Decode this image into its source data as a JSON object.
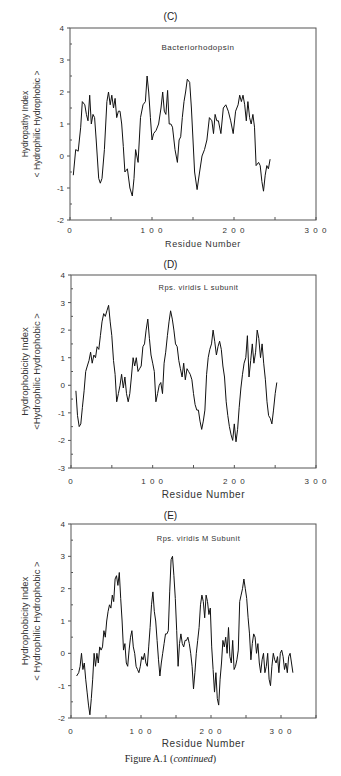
{
  "caption": {
    "prefix": "Figure A.1 (",
    "italic": "continued",
    "suffix": ")"
  },
  "chart_data": [
    {
      "panel": "(C)",
      "type": "line",
      "title": "Bacteriorhodopsin",
      "xlabel": "Residue  Number",
      "ylabel_line1": "Hydropathy Index",
      "ylabel_line2": "< Hydrophilic  Hydrophobic >",
      "xlim": [
        0,
        300
      ],
      "ylim": [
        -2,
        4
      ],
      "xticks": [
        0,
        100,
        200,
        300
      ],
      "xtick_labels": [
        "0",
        "1 0 0",
        "2 0 0",
        "3 0 0"
      ],
      "yticks": [
        -2,
        -1,
        0,
        1,
        2,
        3,
        4
      ],
      "ytick_labels": [
        "-2",
        "-1",
        "0",
        "1",
        "2",
        "3",
        "4"
      ],
      "grid": false,
      "series": [
        {
          "name": "Bacteriorhodopsin",
          "x": [
            4,
            7,
            10,
            13,
            15,
            18,
            20,
            22,
            24,
            26,
            28,
            30,
            32,
            35,
            37,
            39,
            42,
            45,
            47,
            49,
            51,
            53,
            55,
            57,
            59,
            61,
            63,
            65,
            67,
            70,
            73,
            76,
            78,
            80,
            83,
            86,
            89,
            92,
            94,
            96,
            98,
            100,
            102,
            105,
            108,
            111,
            113,
            115,
            117,
            119,
            121,
            123,
            125,
            128,
            131,
            133,
            135,
            137,
            139,
            141,
            143,
            146,
            148,
            150,
            152,
            155,
            158,
            161,
            164,
            167,
            170,
            173,
            175,
            177,
            179,
            181,
            184,
            187,
            190,
            193,
            196,
            199,
            202,
            205,
            207,
            209,
            211,
            213,
            215,
            217,
            219,
            221,
            223,
            225,
            227,
            230,
            232,
            234,
            236,
            238,
            240,
            242,
            244
          ],
          "y": [
            -0.6,
            0.2,
            0.15,
            0.9,
            1.7,
            1.6,
            1.3,
            1.1,
            1.9,
            1.0,
            1.3,
            1.2,
            0.5,
            -0.7,
            -0.85,
            -0.7,
            0.2,
            1.7,
            2.0,
            1.6,
            1.9,
            1.5,
            1.8,
            1.2,
            1.4,
            1.4,
            1.0,
            0.3,
            -0.5,
            -0.4,
            -1.0,
            -1.25,
            -0.7,
            0.2,
            -0.2,
            1.2,
            1.6,
            1.7,
            2.5,
            2.0,
            1.2,
            0.5,
            0.7,
            0.8,
            1.0,
            1.5,
            2.0,
            1.4,
            1.3,
            2.05,
            1.0,
            1.0,
            0.9,
            0.2,
            -0.2,
            0.5,
            0.6,
            1.2,
            1.7,
            2.0,
            2.4,
            2.3,
            1.5,
            0.5,
            -0.5,
            -1.05,
            -0.5,
            0.0,
            0.2,
            0.5,
            1.2,
            1.1,
            0.7,
            1.3,
            1.1,
            1.1,
            0.7,
            1.5,
            1.6,
            1.4,
            1.1,
            0.7,
            1.4,
            1.6,
            1.9,
            1.7,
            1.9,
            1.6,
            1.1,
            1.7,
            1.2,
            1.0,
            1.3,
            0.9,
            -0.3,
            -0.2,
            -0.3,
            -0.8,
            -1.1,
            -0.6,
            -0.3,
            -0.4,
            -0.1
          ]
        }
      ]
    },
    {
      "panel": "(D)",
      "type": "line",
      "title": "Rps.  viridis  L  subunit",
      "xlabel": "Residue  Number",
      "ylabel_line1": "Hydrophobicity Index",
      "ylabel_line2": "<Hydrophilic  Hydrophobic >",
      "xlim": [
        0,
        300
      ],
      "ylim": [
        -3,
        4
      ],
      "xticks": [
        0,
        100,
        200,
        300
      ],
      "xtick_labels": [
        "0",
        "1 0 0",
        "2 0 0",
        "3 0 0"
      ],
      "yticks": [
        -3,
        -2,
        -1,
        0,
        1,
        2,
        3,
        4
      ],
      "ytick_labels": [
        "-3",
        "-2",
        "-1",
        "0",
        "1",
        "2",
        "3",
        "4"
      ],
      "grid": false,
      "series": [
        {
          "name": "Rps. viridis L subunit",
          "x": [
            6,
            8,
            10,
            12,
            14,
            16,
            18,
            20,
            22,
            24,
            26,
            28,
            30,
            32,
            34,
            36,
            38,
            40,
            42,
            44,
            46,
            48,
            50,
            52,
            54,
            56,
            58,
            60,
            62,
            64,
            66,
            68,
            70,
            72,
            74,
            76,
            78,
            80,
            82,
            84,
            86,
            88,
            90,
            92,
            94,
            96,
            98,
            100,
            102,
            104,
            106,
            108,
            110,
            112,
            114,
            116,
            118,
            120,
            122,
            124,
            126,
            128,
            130,
            132,
            134,
            136,
            138,
            140,
            142,
            144,
            146,
            148,
            150,
            152,
            154,
            156,
            158,
            160,
            162,
            164,
            166,
            168,
            170,
            172,
            174,
            176,
            178,
            180,
            182,
            184,
            186,
            188,
            190,
            192,
            194,
            196,
            198,
            200,
            202,
            204,
            206,
            208,
            210,
            212,
            214,
            216,
            218,
            220,
            222,
            224,
            226,
            228,
            230,
            232,
            234,
            236,
            238,
            240,
            242,
            244,
            246,
            248,
            250,
            252,
            254,
            256,
            258,
            260,
            262,
            264,
            266
          ],
          "y": [
            -0.2,
            -1.1,
            -1.5,
            -1.4,
            -0.8,
            -0.2,
            0.5,
            0.7,
            0.9,
            1.2,
            0.8,
            1.1,
            1.0,
            1.4,
            1.3,
            1.8,
            2.3,
            2.6,
            2.5,
            2.7,
            2.9,
            2.3,
            1.8,
            0.9,
            0.4,
            -0.6,
            -0.3,
            0.0,
            0.4,
            -0.1,
            0.3,
            -0.3,
            -0.6,
            -0.3,
            0.3,
            1.0,
            0.7,
            1.0,
            0.5,
            0.6,
            0.7,
            1.4,
            1.5,
            2.0,
            2.4,
            1.7,
            1.1,
            0.8,
            0.5,
            -0.6,
            -0.3,
            0.0,
            0.1,
            -0.3,
            0.8,
            1.2,
            1.8,
            2.3,
            2.7,
            2.4,
            2.0,
            1.5,
            1.4,
            0.9,
            0.6,
            0.3,
            0.8,
            0.2,
            0.6,
            0.5,
            0.4,
            0.2,
            -0.3,
            -0.7,
            -0.9,
            -0.9,
            -1.3,
            -1.6,
            -1.3,
            -0.9,
            0.4,
            1.0,
            1.3,
            1.5,
            2.0,
            1.6,
            1.1,
            1.4,
            1.6,
            1.3,
            0.7,
            0.3,
            -0.6,
            -1.1,
            -1.5,
            -1.8,
            -2.0,
            -1.4,
            -2.05,
            -1.6,
            -0.8,
            -0.1,
            0.4,
            0.8,
            1.0,
            1.8,
            0.3,
            0.9,
            1.5,
            0.8,
            1.2,
            2.0,
            1.7,
            1.0,
            1.5,
            0.8,
            0.2,
            -0.6,
            -1.1,
            -1.2,
            -1.4,
            -0.9,
            -0.3,
            0.1
          ],
          "note": "x spacing normalized"
        }
      ]
    },
    {
      "panel": "(E)",
      "type": "line",
      "title": "Rps.  viridis  M  Subunit",
      "xlabel": "Residue  Number",
      "ylabel_line1": "Hydrophobicity Index",
      "ylabel_line2": "< Hydrophilic  Hydrophobic >",
      "xlim": [
        0,
        350
      ],
      "ylim": [
        -2,
        4
      ],
      "xticks": [
        0,
        100,
        200,
        300
      ],
      "xtick_labels": [
        "0",
        "1 0 0",
        "2 0 0",
        "3 0 0"
      ],
      "yticks": [
        -2,
        -1,
        0,
        1,
        2,
        3,
        4
      ],
      "ytick_labels": [
        "-2",
        "-1",
        "0",
        "1",
        "2",
        "3",
        "4"
      ],
      "grid": false,
      "series": [
        {
          "name": "Rps. viridis M Subunit",
          "x": [
            8,
            11,
            13,
            15,
            17,
            19,
            21,
            23,
            25,
            27,
            29,
            31,
            33,
            35,
            37,
            39,
            41,
            43,
            45,
            47,
            49,
            51,
            53,
            55,
            57,
            59,
            61,
            63,
            65,
            67,
            69,
            71,
            73,
            75,
            77,
            79,
            81,
            83,
            85,
            87,
            89,
            91,
            93,
            95,
            97,
            99,
            101,
            103,
            105,
            107,
            109,
            111,
            113,
            115,
            117,
            119,
            121,
            123,
            125,
            127,
            129,
            131,
            133,
            135,
            137,
            139,
            141,
            143,
            145,
            147,
            149,
            151,
            153,
            155,
            157,
            159,
            161,
            163,
            165,
            167,
            169,
            171,
            173,
            175,
            177,
            179,
            181,
            183,
            185,
            187,
            189,
            191,
            193,
            195,
            197,
            199,
            201,
            203,
            205,
            207,
            209,
            211,
            213,
            215,
            217,
            219,
            221,
            223,
            225,
            227,
            229,
            231,
            233,
            235,
            237,
            239,
            241,
            243,
            245,
            247,
            249,
            251,
            253,
            255,
            257,
            259,
            261,
            263,
            265,
            267,
            269,
            271,
            273,
            275,
            277,
            279,
            281,
            283,
            285,
            287,
            289,
            291,
            293,
            295,
            297,
            299,
            301,
            303,
            305,
            307,
            309,
            311,
            313,
            315,
            317
          ],
          "y": [
            -0.7,
            -0.6,
            -0.4,
            0.0,
            -0.5,
            -0.3,
            -0.8,
            -1.2,
            -1.6,
            -1.9,
            -1.4,
            -0.8,
            0.0,
            -0.4,
            0.0,
            -0.3,
            0.2,
            0.1,
            0.2,
            0.7,
            0.5,
            1.0,
            1.3,
            1.5,
            1.4,
            1.8,
            1.6,
            2.3,
            2.4,
            2.1,
            2.5,
            1.7,
            1.0,
            0.1,
            0.3,
            -0.3,
            -0.4,
            0.1,
            0.5,
            0.7,
            0.2,
            0.0,
            -0.4,
            -0.5,
            -0.6,
            -0.4,
            -0.1,
            -0.2,
            0.0,
            -0.3,
            -0.4,
            0.2,
            0.8,
            1.5,
            1.9,
            1.3,
            1.0,
            0.4,
            -0.2,
            -0.7,
            -0.3,
            0.0,
            0.3,
            0.6,
            0.6,
            0.7,
            1.9,
            2.9,
            3.0,
            2.4,
            1.7,
            0.7,
            -0.4,
            0.3,
            0.6,
            0.3,
            0.2,
            0.4,
            0.4,
            0.5,
            0.3,
            0.0,
            -0.4,
            -1.1,
            -0.6,
            0.0,
            0.4,
            0.8,
            1.5,
            1.8,
            1.6,
            1.1,
            1.8,
            1.6,
            1.2,
            1.4,
            0.2,
            -0.5,
            -1.2,
            -0.6,
            -1.4,
            -1.6,
            -0.8,
            -0.3,
            0.4,
            0.2,
            0.5,
            0.0,
            0.8,
            -0.1,
            -0.3,
            0.4,
            -0.5,
            -0.4,
            -0.2,
            0.1,
            1.6,
            1.8,
            2.0,
            2.3,
            2.0,
            1.7,
            1.1,
            0.6,
            -0.2,
            0.3,
            0.6,
            0.5,
            0.0,
            0.3,
            -0.3,
            -0.6,
            -0.2,
            0.0,
            -0.6,
            -0.4,
            0.0,
            -0.8,
            -1.0,
            -0.4,
            0.0,
            -0.2,
            -0.3,
            -0.1,
            -0.6,
            0.0,
            0.1,
            -0.1,
            -0.5,
            -0.3,
            -0.6,
            -0.1,
            0.0,
            -0.3,
            -0.6
          ]
        }
      ]
    }
  ]
}
